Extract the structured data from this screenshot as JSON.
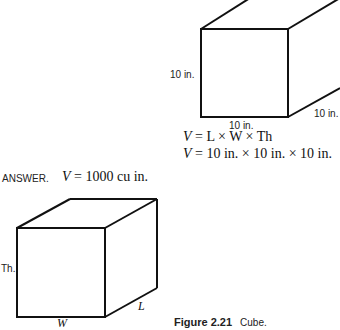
{
  "top_figure": {
    "height_label": "10 in.",
    "width_label": "10 in.",
    "length_label": "10 in."
  },
  "formula": {
    "line1_var": "V",
    "line1_rest": "= L × W × Th",
    "line2_var": "V",
    "line2_rest": "= 10 in. × 10 in. × 10 in."
  },
  "answer": {
    "label": "ANSWER.",
    "var": "V",
    "value": "= 1000 cu in."
  },
  "bottom_figure": {
    "height_label": "Th.",
    "width_label": "W",
    "length_label": "L"
  },
  "caption": {
    "figure_number": "Figure 2.21",
    "text": "Cube."
  }
}
